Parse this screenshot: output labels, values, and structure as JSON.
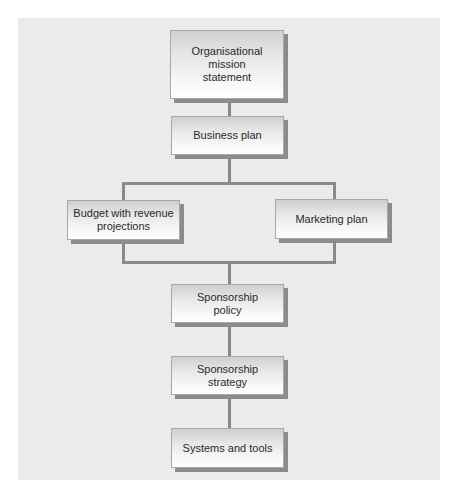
{
  "diagram": {
    "type": "flowchart",
    "nodes": [
      {
        "id": "mission",
        "label": "Organisational mission statement",
        "lines": [
          "Organisational",
          "mission",
          "statement"
        ]
      },
      {
        "id": "business",
        "label": "Business plan",
        "lines": [
          "Business plan"
        ]
      },
      {
        "id": "budget",
        "label": "Budget with revenue projections",
        "lines": [
          "Budget with revenue",
          "projections"
        ]
      },
      {
        "id": "marketing",
        "label": "Marketing plan",
        "lines": [
          "Marketing plan"
        ]
      },
      {
        "id": "policy",
        "label": "Sponsorship policy",
        "lines": [
          "Sponsorship",
          "policy"
        ]
      },
      {
        "id": "strategy",
        "label": "Sponsorship strategy",
        "lines": [
          "Sponsorship",
          "strategy"
        ]
      },
      {
        "id": "systems",
        "label": "Systems and tools",
        "lines": [
          "Systems and tools"
        ]
      }
    ],
    "edges": [
      {
        "from": "mission",
        "to": "business"
      },
      {
        "from": "business",
        "to": "budget"
      },
      {
        "from": "business",
        "to": "marketing"
      },
      {
        "from": "budget",
        "to": "policy"
      },
      {
        "from": "marketing",
        "to": "policy"
      },
      {
        "from": "policy",
        "to": "strategy"
      },
      {
        "from": "strategy",
        "to": "systems"
      }
    ]
  },
  "colors": {
    "panel_background": "#ebebeb",
    "connector": "#8a8a8a",
    "box_shadow": "#8c8c8c",
    "text": "#2a2a2a"
  }
}
